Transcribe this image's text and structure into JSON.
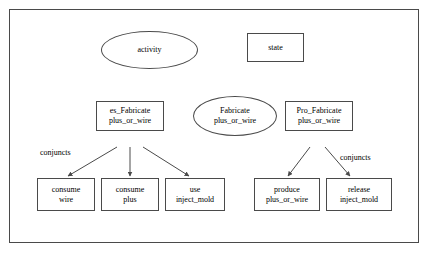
{
  "diagram": {
    "frame": {
      "name": "outer-frame"
    },
    "nodes": [
      {
        "id": "activity",
        "shape": "ellipse",
        "lines": [
          "activity"
        ]
      },
      {
        "id": "state",
        "shape": "rect",
        "lines": [
          "state"
        ]
      },
      {
        "id": "es_fabricate",
        "shape": "rect",
        "lines": [
          "es_Fabricate",
          "plus_or_wire"
        ]
      },
      {
        "id": "fabricate",
        "shape": "ellipse",
        "lines": [
          "Fabricate",
          "plus_or_wire"
        ]
      },
      {
        "id": "pro_fabricate",
        "shape": "rect",
        "lines": [
          "Pro_Fabricate",
          "plus_or_wire"
        ]
      },
      {
        "id": "consume_wire",
        "shape": "rect",
        "lines": [
          "consume",
          "wire"
        ]
      },
      {
        "id": "consume_plus",
        "shape": "rect",
        "lines": [
          "consume",
          "plus"
        ]
      },
      {
        "id": "use_inject_mold",
        "shape": "rect",
        "lines": [
          "use",
          "inject_mold"
        ]
      },
      {
        "id": "produce_plus_or_wire",
        "shape": "rect",
        "lines": [
          "produce",
          "plus_or_wire"
        ]
      },
      {
        "id": "release_inject_mold",
        "shape": "rect",
        "lines": [
          "release",
          "inject_mold"
        ]
      }
    ],
    "annotations": [
      {
        "id": "conjuncts-left",
        "text": "conjuncts"
      },
      {
        "id": "conjuncts-right",
        "text": "conjuncts"
      }
    ],
    "colors": {
      "stroke": "#4a4a4a",
      "text": "#000000",
      "background": "#ffffff"
    }
  }
}
